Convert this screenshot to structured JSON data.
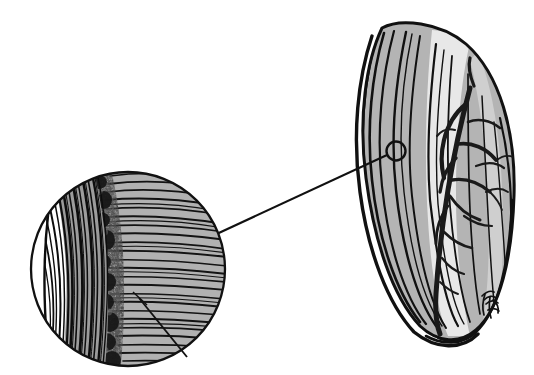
{
  "figure": {
    "title": "Botanical line illustration: grass floret with magnified callus detail",
    "caption": "",
    "background_color": "#ffffff",
    "ink_color": "#111111",
    "fill_gray": "#b4b4b4",
    "fill_gray_light": "#c9c9c9",
    "fill_gray_dark": "#8a8a8a",
    "width": 534,
    "height": 375
  },
  "specimen": {
    "name": "floret-lemma",
    "label": "",
    "apex": {
      "x": 382,
      "y": 28
    },
    "base": {
      "x": 452,
      "y": 336
    },
    "widest": {
      "x": 512,
      "y": 150
    },
    "outline": "M382,28 C366,62 358,118 366,178 C374,240 392,296 420,326 C438,343 460,344 476,330 C500,309 512,258 514,196 C516,132 500,74 466,44 C440,22 400,18 382,28 Z",
    "veins": [
      "M384,33 C372,74 366,128 372,180 C378,238 396,292 420,322",
      "M394,31 C382,76 376,132 382,186 C388,244 404,296 426,324",
      "M406,32 C396,80 390,136 396,190 C402,246 416,298 436,326",
      "M420,36 C412,86 406,142 412,196 C418,250 428,300 446,328",
      "M436,44 C430,94 426,148 430,200 C436,252 444,302 458,326",
      "M452,56 C448,104 446,156 450,206 C454,254 462,300 470,322",
      "M468,74 C468,118 468,166 470,210 C472,252 476,292 480,314",
      "M482,96 C484,136 486,178 488,214 C490,250 492,282 494,302",
      "M494,122 C498,158 500,190 502,218 C504,246 506,270 506,288"
    ],
    "margin_folds": [
      "M370,34 C356,76 350,132 358,190 C366,250 386,302 412,330",
      "M414,330 C438,348 462,348 478,332",
      "M478,332 C502,310 513,258 515,196",
      "M428,336 C444,344 462,342 474,330"
    ]
  },
  "awn_branch": {
    "name": "awn-branching-structure",
    "main_stem": "M470,88 C462,118 454,154 448,190 C442,226 438,262 436,294 C435,312 436,324 440,334",
    "branches": [
      "M466,104 C456,112 448,124 444,140 C441,152 441,166 444,178",
      "M458,144 C472,142 486,148 496,160",
      "M456,158 C448,166 442,178 440,192",
      "M452,180 C464,178 478,182 490,192",
      "M450,196 C458,208 468,216 480,220",
      "M448,206 C440,216 436,230 436,244",
      "M444,232 C452,240 462,246 472,248",
      "M468,122 C478,118 490,120 500,128",
      "M476,166 C486,162 496,162 504,168",
      "M486,192 C494,188 502,188 508,192",
      "M464,216 C472,222 482,226 492,226",
      "M442,258 C448,266 456,272 464,274",
      "M440,282 C446,288 452,292 458,294"
    ]
  },
  "signature": {
    "name": "artist-signature",
    "text": "",
    "x": 487,
    "y": 304,
    "strokes": [
      "M482,296 C486,292 490,290 494,292",
      "M484,300 C488,296 493,295 496,298",
      "M486,304 C490,300 495,300 498,303",
      "M485,294 C483,300 482,308 484,315",
      "M490,297 C489,304 489,312 491,318",
      "M488,310 C492,308 496,308 499,311",
      "M493,300 C497,303 499,308 498,313"
    ]
  },
  "callout": {
    "marker_circle": {
      "name": "callout-marker",
      "cx": 396,
      "cy": 151,
      "r": 9.5
    },
    "leader_line": {
      "name": "callout-leader-line",
      "x1": 387,
      "y1": 155,
      "x2": 208,
      "y2": 238
    },
    "magnifier_circle": {
      "name": "magnifier-circle",
      "cx": 128,
      "cy": 269,
      "r": 97
    },
    "pointer_line": {
      "name": "detail-pointer-line",
      "x1": 141,
      "y1": 300,
      "x2": 185,
      "y2": 355
    }
  },
  "detail_view": {
    "name": "magnified-callus-detail",
    "regions": [
      {
        "name": "smooth-white-margin",
        "description": "blank crescent at left of magnifier"
      },
      {
        "name": "longitudinal-striations",
        "description": "dense near-vertical dark lines",
        "line_count": 14
      },
      {
        "name": "rough-textured-band",
        "description": "mottled granular boundary zone"
      },
      {
        "name": "transverse-striations",
        "description": "fine horizontal lines over gray fill",
        "line_count": 30
      }
    ]
  }
}
